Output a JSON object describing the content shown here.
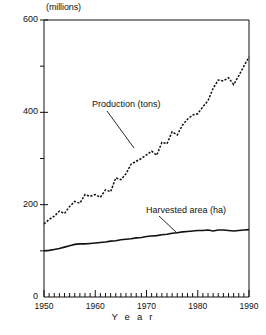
{
  "figure": {
    "unit_label": "(millions)",
    "x_axis_title": "Y e a r"
  },
  "chart_data": {
    "type": "line",
    "title": "",
    "subtitle": "",
    "xlabel": "Y e a r",
    "ylabel": "(millions)",
    "xlim": [
      1950,
      1990
    ],
    "ylim": [
      0,
      600
    ],
    "grid": false,
    "legend": "inline-annotations",
    "x_major_ticks": [
      1950,
      1960,
      1970,
      1980,
      1990
    ],
    "x_minor_tick_interval": 1,
    "y_major_ticks": [
      0,
      200,
      400,
      600
    ],
    "y_minor_ticks": [
      100,
      300,
      500
    ],
    "x_tick_labels": [
      "1950",
      "1960",
      "1970",
      "1980",
      "1990"
    ],
    "y_tick_labels": [
      "0",
      "200",
      "400",
      "600"
    ],
    "x": [
      1950,
      1951,
      1952,
      1953,
      1954,
      1955,
      1956,
      1957,
      1958,
      1959,
      1960,
      1961,
      1962,
      1963,
      1964,
      1965,
      1966,
      1967,
      1968,
      1969,
      1970,
      1971,
      1972,
      1973,
      1974,
      1975,
      1976,
      1977,
      1978,
      1979,
      1980,
      1981,
      1982,
      1983,
      1984,
      1985,
      1986,
      1987,
      1988,
      1989,
      1990
    ],
    "series": [
      {
        "name": "Production (tons)",
        "style": "dashed",
        "values": [
          158,
          168,
          175,
          186,
          181,
          196,
          207,
          203,
          222,
          218,
          222,
          216,
          232,
          228,
          258,
          254,
          267,
          288,
          294,
          300,
          308,
          316,
          307,
          335,
          332,
          358,
          351,
          372,
          385,
          394,
          397,
          412,
          425,
          452,
          470,
          468,
          475,
          460,
          479,
          500,
          520
        ]
      },
      {
        "name": "Harvested area (ha)",
        "style": "solid",
        "values": [
          100,
          101,
          103,
          105,
          108,
          111,
          114,
          115,
          115,
          116,
          117,
          118,
          119,
          121,
          122,
          124,
          125,
          126,
          128,
          129,
          131,
          132,
          133,
          135,
          136,
          138,
          139,
          141,
          142,
          143,
          144,
          144,
          145,
          143,
          145,
          145,
          144,
          143,
          144,
          145,
          146
        ]
      }
    ],
    "annotations": [
      {
        "text": "Production (tons)",
        "points_to_year": 1971,
        "points_to_value": 316
      },
      {
        "text": "Harvested area (ha)",
        "points_to_year": 1978,
        "points_to_value": 142
      }
    ]
  }
}
